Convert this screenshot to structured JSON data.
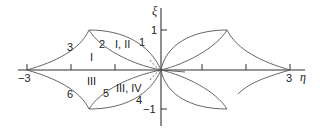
{
  "axes": {
    "x_label": "η",
    "y_label": "ξ",
    "x_ticks": [
      {
        "value": -3,
        "label": "−3"
      },
      {
        "value": -2,
        "label": ""
      },
      {
        "value": -1,
        "label": ""
      },
      {
        "value": 1,
        "label": ""
      },
      {
        "value": 2,
        "label": ""
      },
      {
        "value": 3,
        "label": "3"
      }
    ],
    "y_ticks": [
      {
        "value": 1,
        "label": "1"
      },
      {
        "value": -1,
        "label": "−1"
      }
    ],
    "x_range": [
      -3.2,
      3.3
    ],
    "y_range": [
      -1.4,
      1.5
    ]
  },
  "curve_labels": {
    "c1": "1",
    "c2": "2",
    "c3": "3",
    "c4": "4",
    "c5": "5",
    "c6": "6"
  },
  "region_labels": {
    "r1": "I",
    "r12": "I, II",
    "r3": "III",
    "r34": "III, IV"
  },
  "colors": {
    "curve": "#555555",
    "axis": "#333333",
    "text": "#222222"
  }
}
